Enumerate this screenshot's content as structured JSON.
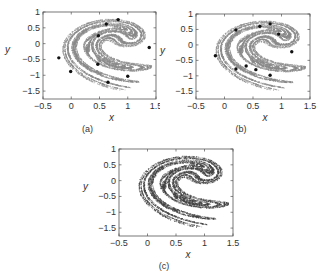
{
  "figure": {
    "attractor_color": "#8a8a8a",
    "marker_color": "#111111",
    "axis_color": "#555555"
  },
  "chart_data": [
    {
      "type": "scatter",
      "panel_label": "(a)",
      "title": "",
      "xlabel": "x",
      "ylabel": "y",
      "xlim": [
        -0.5,
        1.5
      ],
      "ylim": [
        -1.75,
        1
      ],
      "xticks": [
        "-0.5",
        "0",
        "0.5",
        "1",
        "1.5"
      ],
      "yticks": [
        "1",
        "0.5",
        "0",
        "-0.5",
        "-1",
        "-1.5"
      ],
      "grid": false,
      "legend": null,
      "series": [
        {
          "name": "attractor",
          "style": "dense gray points"
        },
        {
          "name": "highlighted points",
          "style": "black circles",
          "points": [
            [
              0.83,
              0.76
            ],
            [
              0.62,
              0.62
            ],
            [
              0.48,
              0.25
            ],
            [
              1.38,
              -0.12
            ],
            [
              -0.22,
              -0.45
            ],
            [
              0.47,
              -0.65
            ],
            [
              -0.01,
              -0.88
            ],
            [
              1.0,
              -1.03
            ],
            [
              0.65,
              -1.22
            ]
          ]
        }
      ]
    },
    {
      "type": "scatter",
      "panel_label": "(b)",
      "title": "",
      "xlabel": "x",
      "ylabel": "y",
      "xlim": [
        -0.5,
        1.5
      ],
      "ylim": [
        -1.75,
        1
      ],
      "xticks": [
        "-0.5",
        "0",
        "0.5",
        "1",
        "1.5"
      ],
      "yticks": [
        "1",
        "0.5",
        "0",
        "-0.5",
        "-1",
        "-1.5"
      ],
      "grid": false,
      "legend": null,
      "series": [
        {
          "name": "attractor",
          "style": "dense gray points"
        },
        {
          "name": "highlighted points",
          "style": "black circles",
          "points": [
            [
              0.8,
              0.68
            ],
            [
              0.62,
              0.6
            ],
            [
              0.2,
              0.48
            ],
            [
              0.95,
              0.35
            ],
            [
              1.18,
              -0.22
            ],
            [
              -0.16,
              -0.35
            ],
            [
              0.2,
              -0.78
            ],
            [
              0.38,
              -0.68
            ],
            [
              0.55,
              -0.8
            ],
            [
              0.8,
              -0.98
            ]
          ]
        }
      ]
    },
    {
      "type": "scatter",
      "panel_label": "(c)",
      "title": "",
      "xlabel": "x",
      "ylabel": "y",
      "xlim": [
        -0.5,
        1.5
      ],
      "ylim": [
        -1.75,
        1
      ],
      "xticks": [
        "-0.5",
        "0",
        "0.5",
        "1",
        "1.5"
      ],
      "yticks": [
        "1",
        "0.5",
        "0",
        "-0.5",
        "-1",
        "-1.5"
      ],
      "grid": false,
      "legend": null,
      "series": [
        {
          "name": "attractor",
          "style": "dense gray points"
        },
        {
          "name": "highlighted points",
          "style": "many small black points densely covering the attractor"
        }
      ]
    }
  ],
  "panels": [
    {
      "label": "(a)",
      "xlabel": "x",
      "ylabel": "y"
    },
    {
      "label": "(b)",
      "xlabel": "x",
      "ylabel": "y"
    },
    {
      "label": "(c)",
      "xlabel": "x",
      "ylabel": "y"
    }
  ]
}
